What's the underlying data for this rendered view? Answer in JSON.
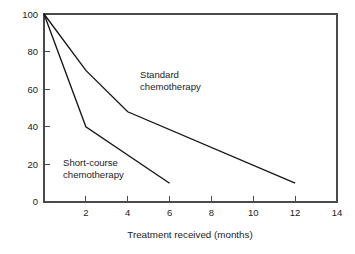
{
  "chart_data": {
    "type": "line",
    "title": "",
    "subtitle": "",
    "xlabel": "Treatment received (months)",
    "ylabel": "",
    "xlim": [
      0,
      14
    ],
    "ylim": [
      0,
      100
    ],
    "xticks": [
      0,
      2,
      4,
      6,
      8,
      10,
      12,
      14
    ],
    "xticklabels": [
      "",
      "2",
      "4",
      "6",
      "8",
      "10",
      "12",
      "14"
    ],
    "yticks": [
      0,
      20,
      40,
      60,
      80,
      100
    ],
    "yticklabels": [
      "0",
      "20",
      "40",
      "60",
      "80",
      "100"
    ],
    "grid": false,
    "legend": "inline-annotations",
    "background_color": "#ffffff",
    "frame_color": "#4a4a4a",
    "line_color": "#161616",
    "series": [
      {
        "name": "Standard chemotherapy",
        "label_lines": [
          "Standard",
          "chemotherapy"
        ],
        "x": [
          0,
          2,
          4,
          12
        ],
        "values": [
          100,
          70,
          48,
          10
        ],
        "color": "#161616"
      },
      {
        "name": "Short-course chemotherapy",
        "label_lines": [
          "Short-course",
          "chemotherapy"
        ],
        "x": [
          0,
          2,
          6
        ],
        "values": [
          100,
          40,
          10
        ],
        "color": "#161616"
      }
    ],
    "annotations": [
      {
        "name": "standard-chemotherapy-label",
        "lines": [
          "Standard",
          "chemotherapy"
        ],
        "x_px": 140,
        "y_px": 78
      },
      {
        "name": "short-course-chemotherapy-label",
        "lines": [
          "Short-course",
          "chemotherapy"
        ],
        "x_px": 63,
        "y_px": 166
      }
    ]
  },
  "axis_titles": {
    "x": "Treatment received (months)"
  },
  "y_tick_text": {
    "t0": "0",
    "t20": "20",
    "t40": "40",
    "t60": "60",
    "t80": "80",
    "t100": "100"
  },
  "x_tick_text": {
    "t2": "2",
    "t4": "4",
    "t6": "6",
    "t8": "8",
    "t10": "10",
    "t12": "12",
    "t14": "14"
  },
  "annotation_text": {
    "standard_line1": "Standard",
    "standard_line2": "chemotherapy",
    "short_line1": "Short-course",
    "short_line2": "chemotherapy"
  }
}
